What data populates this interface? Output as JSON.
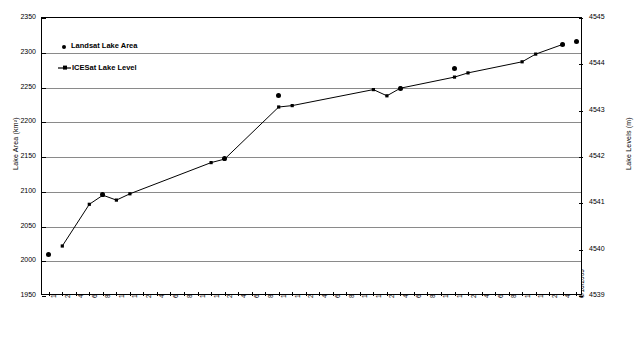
{
  "chart_data": {
    "type": "line",
    "title": "",
    "xlabel": "",
    "ylabel": "Lake Area (km²)",
    "y2label": "Lake Levels (m)",
    "ylim": [
      1950,
      2350
    ],
    "yticks": [
      1950,
      2000,
      2050,
      2100,
      2150,
      2200,
      2250,
      2300,
      2350
    ],
    "y2lim": [
      4539,
      4545
    ],
    "y2ticks": [
      4539,
      4540,
      4541,
      4542,
      4543,
      4544,
      4545
    ],
    "grid": true,
    "legend_position": "upper-left-inside",
    "legend": [
      "Landsat Lake Area",
      "ICESat Lake Level"
    ],
    "x_tick_labels": [
      "12/16/2002",
      "2/16/2003",
      "4/16/2003",
      "6/16/2003",
      "8/16/2003",
      "10/16/2003",
      "12/16/2003",
      "2/16/2004",
      "4/16/2004",
      "6/16/2004",
      "8/16/2004",
      "10/16/2004",
      "12/16/2004",
      "2/16/2005",
      "4/16/2005",
      "6/16/2005",
      "8/16/2005",
      "10/16/2005",
      "12/16/2005",
      "2/16/2006",
      "4/16/2006",
      "6/16/2006",
      "8/16/2006",
      "10/16/2006",
      "12/16/2006",
      "2/16/2007",
      "4/16/2007",
      "6/16/2007",
      "8/16/2007",
      "10/16/2007",
      "12/16/2007",
      "2/16/2008",
      "4/16/2008",
      "6/16/2008",
      "8/16/2008",
      "10/16/2008",
      "12/16/2008",
      "2/16/2009",
      "4/16/2009",
      "6/16/2009"
    ],
    "series": [
      {
        "name": "ICESat Lake Level",
        "axis": "right",
        "marker": "small-square",
        "line": true,
        "points": [
          {
            "date": "2/16/2003",
            "level": 4539.95,
            "area_equiv": 2022
          },
          {
            "date": "6/16/2003",
            "level": 4540.85,
            "area_equiv": 2082
          },
          {
            "date": "8/16/2003",
            "level": 4541.05,
            "area_equiv": 2095
          },
          {
            "date": "10/16/2003",
            "level": 4540.95,
            "area_equiv": 2088
          },
          {
            "date": "12/16/2003",
            "level": 4541.08,
            "area_equiv": 2097
          },
          {
            "date": "12/16/2004",
            "level": 4541.75,
            "area_equiv": 2142
          },
          {
            "date": "2/16/2005",
            "level": 4541.82,
            "area_equiv": 2147
          },
          {
            "date": "10/16/2005",
            "level": 4542.95,
            "area_equiv": 2222
          },
          {
            "date": "12/16/2005",
            "level": 4542.98,
            "area_equiv": 2224
          },
          {
            "date": "12/16/2006",
            "level": 4543.32,
            "area_equiv": 2247
          },
          {
            "date": "2/16/2007",
            "level": 4543.18,
            "area_equiv": 2238
          },
          {
            "date": "4/16/2007",
            "level": 4543.35,
            "area_equiv": 2249
          },
          {
            "date": "12/16/2007",
            "level": 4543.6,
            "area_equiv": 2265
          },
          {
            "date": "2/16/2008",
            "level": 4543.68,
            "area_equiv": 2271
          },
          {
            "date": "10/16/2008",
            "level": 4543.92,
            "area_equiv": 2287
          },
          {
            "date": "12/16/2008",
            "level": 4544.1,
            "area_equiv": 2298
          },
          {
            "date": "4/16/2009",
            "level": 4544.3,
            "area_equiv": 2312
          }
        ]
      },
      {
        "name": "Landsat Lake Area",
        "axis": "left",
        "marker": "dot",
        "line": false,
        "points": [
          {
            "date": "12/16/2002",
            "area": 2010
          },
          {
            "date": "8/16/2003",
            "area": 2096
          },
          {
            "date": "2/16/2005",
            "area": 2148
          },
          {
            "date": "10/16/2005",
            "area": 2238
          },
          {
            "date": "4/16/2007",
            "area": 2249
          },
          {
            "date": "12/16/2007",
            "area": 2277
          },
          {
            "date": "4/16/2009",
            "area": 2312
          },
          {
            "date": "6/16/2009",
            "area": 2316
          }
        ]
      }
    ]
  },
  "colors": {
    "axis": "#000000",
    "grid": "#8a8a8a",
    "series_line": "#000000",
    "marker": "#000000",
    "background": "#ffffff"
  }
}
